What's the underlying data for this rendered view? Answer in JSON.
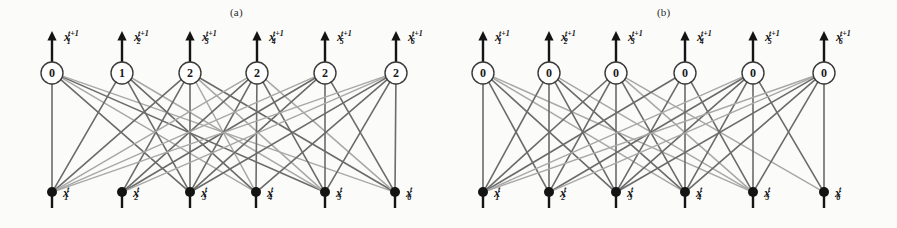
{
  "figure": {
    "width": 897,
    "height": 228,
    "background": "#fbfbfa",
    "ink": "#2b2b2b",
    "edge_dark": "#6b6b6b",
    "edge_light": "#a8a8a8",
    "node_fill": "#141414"
  },
  "panels": [
    {
      "id": "a",
      "caption": "(a)",
      "caption_x": 230,
      "caption_y": 6,
      "top_nodes": [
        {
          "index": 1,
          "value": "0",
          "cx": 52,
          "cy": 73,
          "label_base": "x",
          "label_sub": "1",
          "label_sup": "t+1",
          "label_x": 64,
          "label_y": 30
        },
        {
          "index": 2,
          "value": "1",
          "cx": 122,
          "cy": 73,
          "label_base": "x",
          "label_sub": "2",
          "label_sup": "t+1",
          "label_x": 134,
          "label_y": 30
        },
        {
          "index": 3,
          "value": "2",
          "cx": 190,
          "cy": 73,
          "label_base": "x",
          "label_sub": "3",
          "label_sup": "t+1",
          "label_x": 202,
          "label_y": 30
        },
        {
          "index": 4,
          "value": "2",
          "cx": 257,
          "cy": 73,
          "label_base": "x",
          "label_sub": "4",
          "label_sup": "t+1",
          "label_x": 269,
          "label_y": 30
        },
        {
          "index": 5,
          "value": "2",
          "cx": 325,
          "cy": 73,
          "label_base": "x",
          "label_sub": "5",
          "label_sup": "t+1",
          "label_x": 337,
          "label_y": 30
        },
        {
          "index": 6,
          "value": "2",
          "cx": 396,
          "cy": 73,
          "label_base": "x",
          "label_sub": "6",
          "label_sup": "t+1",
          "label_x": 408,
          "label_y": 30
        }
      ],
      "bottom_nodes": [
        {
          "index": 1,
          "cx": 52,
          "cy": 192,
          "label_base": "x",
          "label_sub": "1",
          "label_sup": "t",
          "label_x": 63,
          "label_y": 192
        },
        {
          "index": 2,
          "cx": 122,
          "cy": 192,
          "label_base": "x",
          "label_sub": "2",
          "label_sup": "t",
          "label_x": 133,
          "label_y": 192
        },
        {
          "index": 3,
          "cx": 190,
          "cy": 192,
          "label_base": "x",
          "label_sub": "3",
          "label_sup": "t",
          "label_x": 201,
          "label_y": 192
        },
        {
          "index": 4,
          "cx": 256,
          "cy": 192,
          "label_base": "x",
          "label_sub": "4",
          "label_sup": "t",
          "label_x": 267,
          "label_y": 192
        },
        {
          "index": 5,
          "cx": 325,
          "cy": 192,
          "label_base": "x",
          "label_sub": "5",
          "label_sup": "t",
          "label_x": 336,
          "label_y": 192
        },
        {
          "index": 6,
          "cx": 395,
          "cy": 192,
          "label_base": "x",
          "label_sub": "6",
          "label_sup": "t",
          "label_x": 406,
          "label_y": 192
        }
      ],
      "edges": [
        [
          1,
          1,
          "dark"
        ],
        [
          1,
          3,
          "dark"
        ],
        [
          1,
          4,
          "light"
        ],
        [
          1,
          5,
          "dark"
        ],
        [
          1,
          6,
          "light"
        ],
        [
          2,
          1,
          "dark"
        ],
        [
          2,
          3,
          "dark"
        ],
        [
          2,
          4,
          "dark"
        ],
        [
          2,
          5,
          "light"
        ],
        [
          3,
          1,
          "dark"
        ],
        [
          3,
          2,
          "dark"
        ],
        [
          3,
          3,
          "dark"
        ],
        [
          3,
          4,
          "light"
        ],
        [
          3,
          5,
          "light"
        ],
        [
          3,
          6,
          "dark"
        ],
        [
          4,
          1,
          "light"
        ],
        [
          4,
          2,
          "dark"
        ],
        [
          4,
          3,
          "dark"
        ],
        [
          4,
          4,
          "dark"
        ],
        [
          4,
          5,
          "dark"
        ],
        [
          4,
          6,
          "light"
        ],
        [
          5,
          1,
          "light"
        ],
        [
          5,
          2,
          "dark"
        ],
        [
          5,
          3,
          "dark"
        ],
        [
          5,
          5,
          "dark"
        ],
        [
          5,
          6,
          "dark"
        ],
        [
          6,
          1,
          "light"
        ],
        [
          6,
          2,
          "light"
        ],
        [
          6,
          3,
          "dark"
        ],
        [
          6,
          4,
          "dark"
        ],
        [
          6,
          5,
          "dark"
        ],
        [
          6,
          6,
          "dark"
        ]
      ]
    },
    {
      "id": "b",
      "caption": "(b)",
      "caption_x": 657,
      "caption_y": 6,
      "top_nodes": [
        {
          "index": 1,
          "value": "0",
          "cx": 483,
          "cy": 73,
          "label_base": "x",
          "label_sub": "1",
          "label_sup": "t+1",
          "label_x": 495,
          "label_y": 30
        },
        {
          "index": 2,
          "value": "0",
          "cx": 549,
          "cy": 73,
          "label_base": "x",
          "label_sub": "2",
          "label_sup": "t+1",
          "label_x": 561,
          "label_y": 30
        },
        {
          "index": 3,
          "value": "0",
          "cx": 616,
          "cy": 73,
          "label_base": "x",
          "label_sub": "3",
          "label_sup": "t+1",
          "label_x": 628,
          "label_y": 30
        },
        {
          "index": 4,
          "value": "0",
          "cx": 685,
          "cy": 73,
          "label_base": "x",
          "label_sub": "4",
          "label_sup": "t+1",
          "label_x": 697,
          "label_y": 30
        },
        {
          "index": 5,
          "value": "0",
          "cx": 753,
          "cy": 73,
          "label_base": "x",
          "label_sub": "5",
          "label_sup": "t+1",
          "label_x": 765,
          "label_y": 30
        },
        {
          "index": 6,
          "value": "0",
          "cx": 824,
          "cy": 73,
          "label_base": "x",
          "label_sub": "6",
          "label_sup": "t+1",
          "label_x": 836,
          "label_y": 30
        }
      ],
      "bottom_nodes": [
        {
          "index": 1,
          "cx": 483,
          "cy": 192,
          "label_base": "x",
          "label_sub": "1",
          "label_sup": "t",
          "label_x": 494,
          "label_y": 192
        },
        {
          "index": 2,
          "cx": 549,
          "cy": 192,
          "label_base": "x",
          "label_sub": "2",
          "label_sup": "t",
          "label_x": 560,
          "label_y": 192
        },
        {
          "index": 3,
          "cx": 616,
          "cy": 192,
          "label_base": "x",
          "label_sub": "3",
          "label_sup": "t",
          "label_x": 627,
          "label_y": 192
        },
        {
          "index": 4,
          "cx": 685,
          "cy": 192,
          "label_base": "x",
          "label_sub": "4",
          "label_sup": "t",
          "label_x": 696,
          "label_y": 192
        },
        {
          "index": 5,
          "cx": 753,
          "cy": 192,
          "label_base": "x",
          "label_sub": "5",
          "label_sup": "t",
          "label_x": 764,
          "label_y": 192
        },
        {
          "index": 6,
          "cx": 824,
          "cy": 192,
          "label_base": "x",
          "label_sub": "6",
          "label_sup": "t",
          "label_x": 835,
          "label_y": 192
        }
      ],
      "edges": [
        [
          1,
          1,
          "dark"
        ],
        [
          1,
          2,
          "dark"
        ],
        [
          1,
          3,
          "dark"
        ],
        [
          1,
          4,
          "light"
        ],
        [
          1,
          5,
          "light"
        ],
        [
          2,
          1,
          "dark"
        ],
        [
          2,
          2,
          "dark"
        ],
        [
          2,
          3,
          "dark"
        ],
        [
          2,
          4,
          "dark"
        ],
        [
          2,
          5,
          "light"
        ],
        [
          3,
          1,
          "dark"
        ],
        [
          3,
          2,
          "dark"
        ],
        [
          3,
          3,
          "dark"
        ],
        [
          3,
          4,
          "dark"
        ],
        [
          3,
          5,
          "light"
        ],
        [
          3,
          6,
          "light"
        ],
        [
          4,
          1,
          "dark"
        ],
        [
          4,
          3,
          "dark"
        ],
        [
          4,
          4,
          "dark"
        ],
        [
          4,
          5,
          "dark"
        ],
        [
          5,
          1,
          "light"
        ],
        [
          5,
          2,
          "dark"
        ],
        [
          5,
          3,
          "dark"
        ],
        [
          5,
          4,
          "dark"
        ],
        [
          5,
          5,
          "dark"
        ],
        [
          5,
          6,
          "dark"
        ],
        [
          6,
          1,
          "light"
        ],
        [
          6,
          2,
          "light"
        ],
        [
          6,
          3,
          "dark"
        ],
        [
          6,
          4,
          "dark"
        ],
        [
          6,
          5,
          "dark"
        ],
        [
          6,
          6,
          "dark"
        ]
      ]
    }
  ],
  "geometry": {
    "circle_r": 11,
    "top_arrow_tip_y": 31,
    "top_arrow_tail_y": 62,
    "bottom_stem_bottom_y": 208,
    "dot_r": 5
  }
}
